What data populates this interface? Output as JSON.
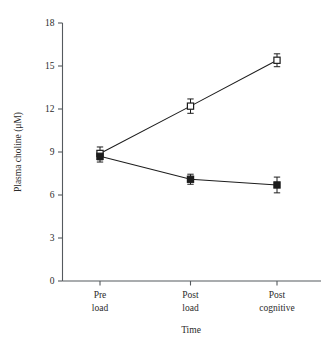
{
  "chart_data": {
    "type": "line",
    "title": "",
    "xlabel": "Time",
    "ylabel": "Plasma choline (μM)",
    "categories": [
      "Pre load",
      "Post load",
      "Post cognitive"
    ],
    "category_lines": [
      [
        "Pre",
        "load"
      ],
      [
        "Post",
        "load"
      ],
      [
        "Post",
        "cognitive"
      ]
    ],
    "ylim": [
      0,
      18
    ],
    "yticks": [
      0,
      3,
      6,
      9,
      12,
      15,
      18
    ],
    "ytick_labels": [
      "0",
      "3",
      "6",
      "9",
      "12",
      "15",
      "18"
    ],
    "grid": false,
    "legend": "none",
    "series": [
      {
        "name": "open-square-series",
        "marker": "open-square",
        "values": [
          8.9,
          12.2,
          15.4
        ],
        "errors": [
          0.45,
          0.5,
          0.45
        ]
      },
      {
        "name": "filled-square-series",
        "marker": "filled-square",
        "values": [
          8.7,
          7.1,
          6.7
        ],
        "errors": [
          0.4,
          0.35,
          0.55
        ]
      }
    ]
  },
  "figure": {
    "y_axis_title": "Plasma choline (μM)",
    "x_axis_title": "Time"
  }
}
